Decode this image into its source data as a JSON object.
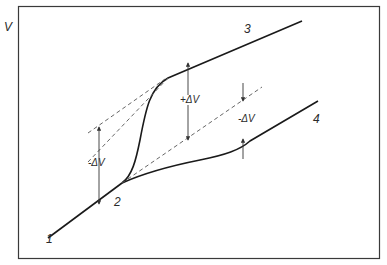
{
  "diagram": {
    "axis_label": "V",
    "points": [
      {
        "id": "1",
        "label": "1"
      },
      {
        "id": "2",
        "label": "2"
      },
      {
        "id": "3",
        "label": "3"
      },
      {
        "id": "4",
        "label": "4"
      }
    ],
    "annotations": {
      "left_delta": "-ΔV",
      "center_delta": "+ΔV",
      "right_delta": "-ΔV"
    },
    "colors": {
      "line": "#1a1a1a",
      "dashed": "#555555",
      "frame": "#3a3a3a"
    }
  }
}
